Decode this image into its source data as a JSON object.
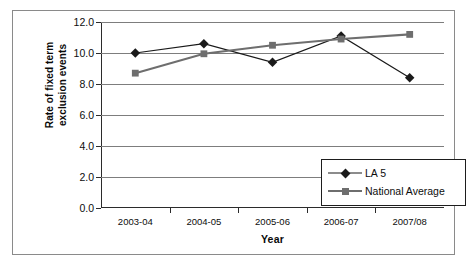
{
  "chart_data": {
    "type": "line",
    "title": "",
    "xlabel": "Year",
    "ylabel": "Rate of fixed term exclusion events",
    "ylabel_line1": "Rate of fixed term",
    "ylabel_line2": "exclusion events",
    "categories": [
      "2003-04",
      "2004-05",
      "2005-06",
      "2006-07",
      "2007/08"
    ],
    "series": [
      {
        "name": "LA 5",
        "values": [
          10.0,
          10.6,
          9.4,
          11.1,
          8.4
        ],
        "color": "#1a1a1a",
        "marker": "diamond"
      },
      {
        "name": "National Average",
        "values": [
          8.7,
          9.95,
          10.5,
          10.9,
          11.2
        ],
        "color": "#6e6e6e",
        "marker": "square"
      }
    ],
    "ylim": [
      0.0,
      12.0
    ],
    "yticks": [
      "0.0",
      "2.0",
      "4.0",
      "6.0",
      "8.0",
      "10.0",
      "12.0"
    ],
    "ytick_values": [
      0.0,
      2.0,
      4.0,
      6.0,
      8.0,
      10.0,
      12.0
    ],
    "grid": true,
    "grid_axis": "y",
    "legend_position": "bottom-right",
    "axis_color": "#2b2b2b",
    "grid_color": "#7d7d7d",
    "frame_color": "#8a8a8a",
    "background": "#ffffff"
  }
}
